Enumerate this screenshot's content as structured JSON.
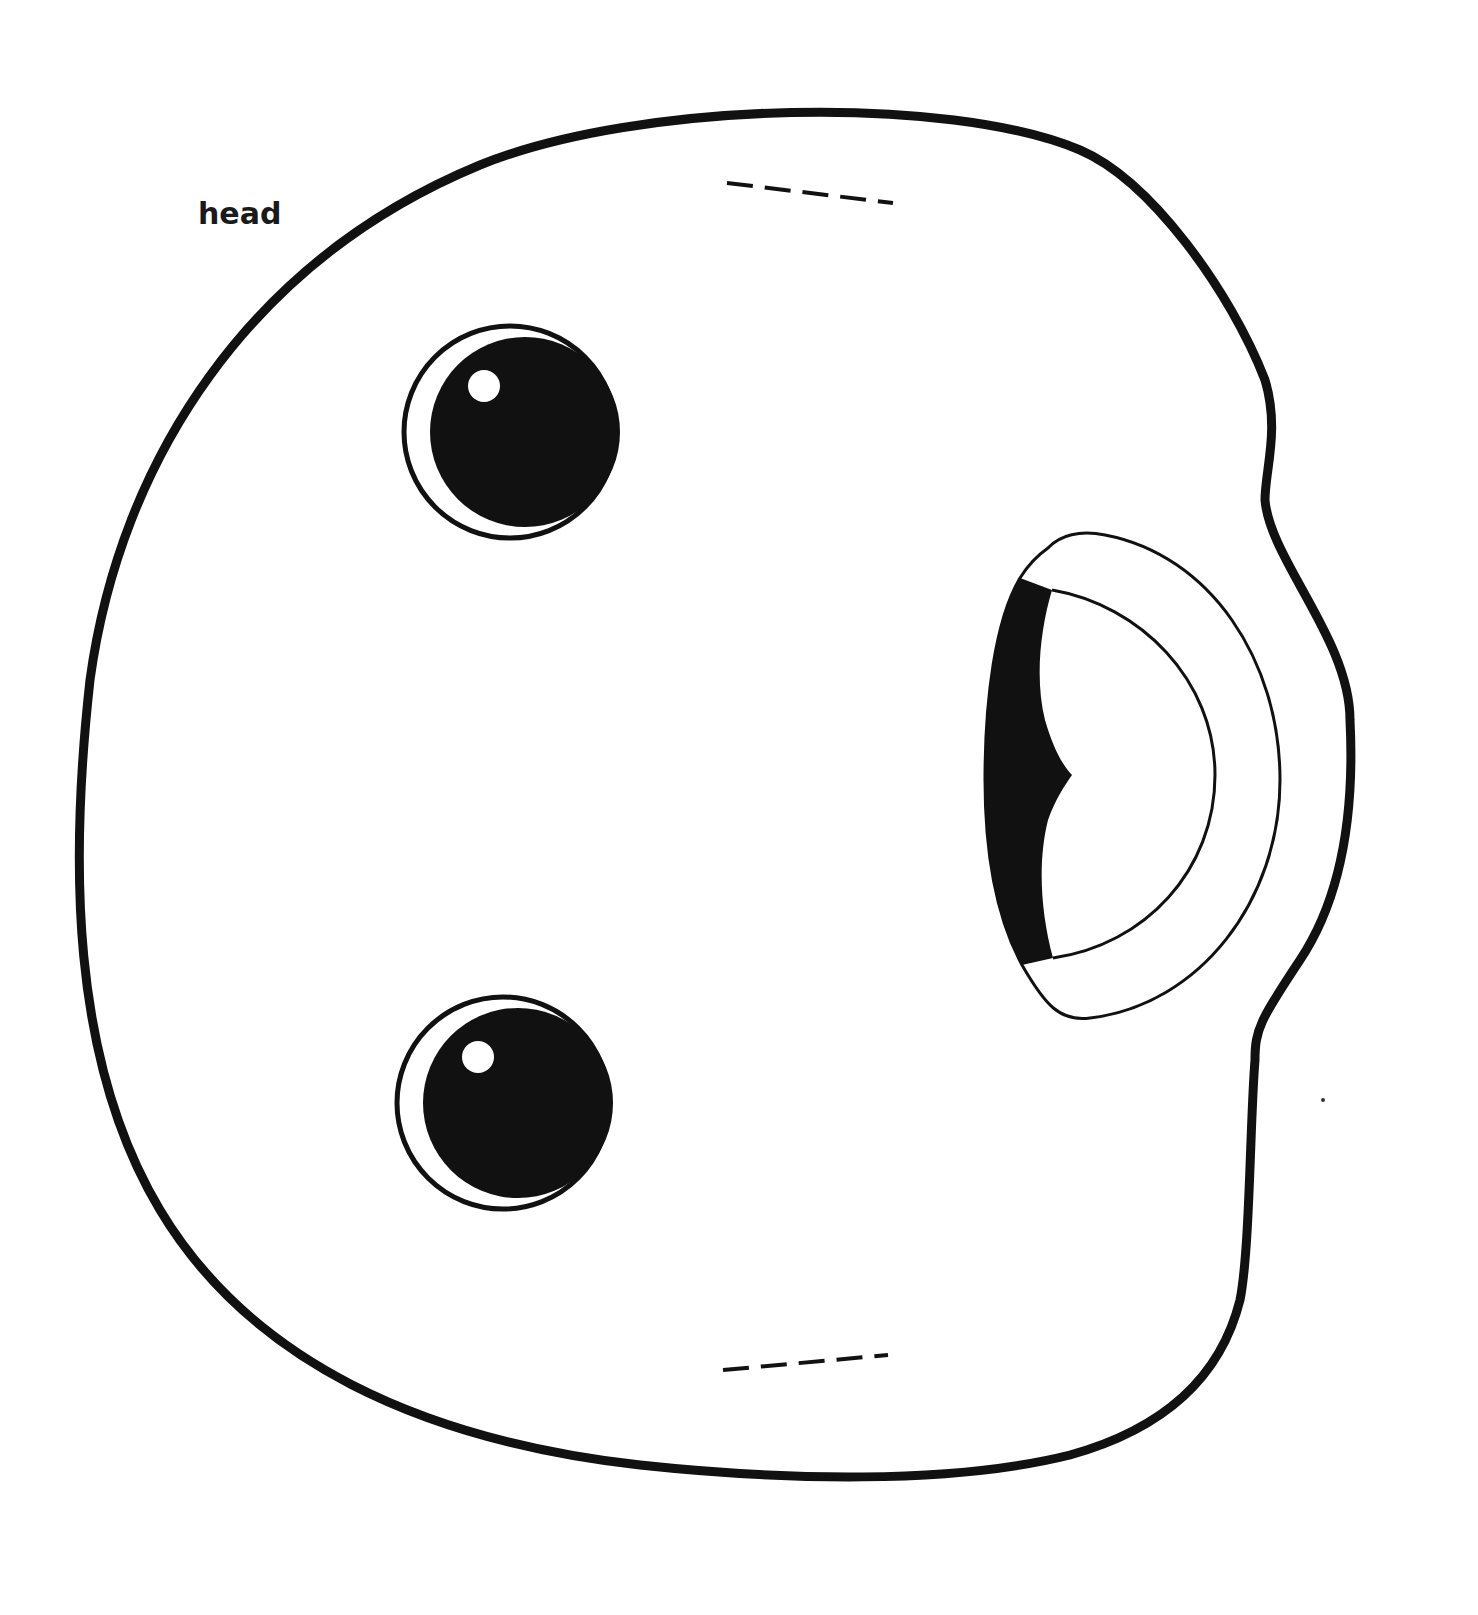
{
  "page": {
    "label": "head",
    "colors": {
      "outline": "#111111",
      "fill": "#ffffff",
      "background": "#ffffff"
    }
  },
  "figure": {
    "type": "cutout-template",
    "parts": [
      "head-outline",
      "left-eye-top",
      "left-eye-bottom",
      "mouth",
      "fold-line-top",
      "fold-line-bottom"
    ]
  }
}
